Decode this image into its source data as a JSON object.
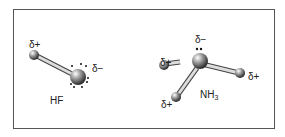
{
  "molecules": [
    {
      "name": "HF",
      "labels": {
        "h": "δ+",
        "f": "δ−"
      }
    },
    {
      "name_main": "NH",
      "name_sub": "3",
      "labels": {
        "n": "δ−",
        "h_left": "δ+",
        "h_right": "δ+",
        "h_bottom": "δ+"
      }
    }
  ]
}
